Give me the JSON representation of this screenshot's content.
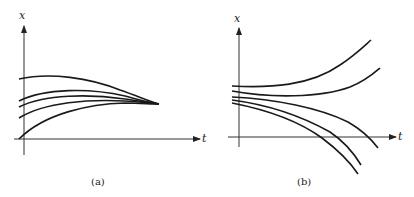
{
  "panels": [
    {
      "id": "a",
      "caption": "(a)",
      "x_axis_label": "t",
      "y_axis_label": "x",
      "description": "Solution curves converging to a single point as t increases",
      "curve_count": 5
    },
    {
      "id": "b",
      "caption": "(b)",
      "x_axis_label": "t",
      "y_axis_label": "x",
      "description": "Solution curves diverging as t increases (two upward, three downward)",
      "curve_count": 5
    }
  ],
  "colors": {
    "line": "#1a1a1a",
    "axis": "#333333"
  }
}
